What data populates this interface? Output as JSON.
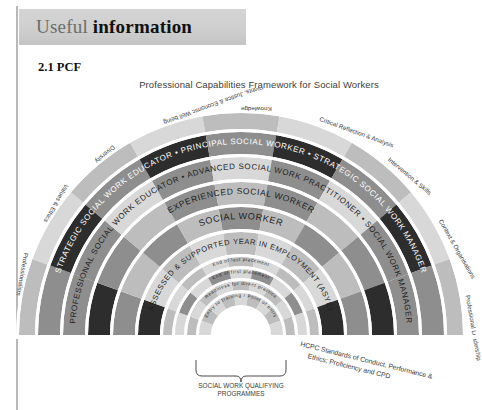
{
  "header": {
    "title_light": "Useful",
    "title_bold": "information",
    "band_color": "#cfcfcf"
  },
  "section": {
    "number_label": "2.1 PCF"
  },
  "figure": {
    "title": "Professional Capabilities Framework for Social Workers",
    "colors": {
      "dark": "#2d2d2d",
      "mid": "#8e8e8e",
      "light": "#bdbdbd",
      "pale": "#d8d8d8",
      "gap": "#ffffff",
      "text_on_dark": "#ffffff",
      "text_on_light": "#1d1d1d",
      "label": "#3a3a3a"
    },
    "rings": [
      {
        "label": "PRINCIPAL SOCIAL WORKER",
        "level": 9,
        "text_color": "#ffffff"
      },
      {
        "label": "ADVANCED SOCIAL WORK PRACTITIONER",
        "level": 8,
        "text_color": "#1d1d1d"
      },
      {
        "label": "EXPERIENCED SOCIAL WORKER",
        "level": 7,
        "text_color": "#1d1d1d"
      },
      {
        "label": "SOCIAL WORKER",
        "level": 6,
        "text_color": "#1d1d1d"
      },
      {
        "label": "ASSESSED & SUPPORTED YEAR IN EMPLOYMENT (ASYE)",
        "level": 5,
        "text_color": "#1d1d1d"
      }
    ],
    "left_rings": [
      {
        "label": "STRATEGIC SOCIAL WORK EDUCATOR"
      },
      {
        "label": "PROFESSIONAL SOCIAL WORK EDUCATOR"
      }
    ],
    "right_rings": [
      {
        "label": "STRATEGIC SOCIAL WORK MANAGER"
      },
      {
        "label": "SOCIAL WORK MANAGER"
      }
    ],
    "separator_glyph": "•",
    "domains": [
      {
        "label": "Professionalism"
      },
      {
        "label": "Values & Ethics"
      },
      {
        "label": "Diversity"
      },
      {
        "label": "Rights, Justice & Economic Well being"
      },
      {
        "label": "Knowledge"
      },
      {
        "label": "Critical Reflection & Analysis"
      },
      {
        "label": "Intervention & Skills"
      },
      {
        "label": "Context & Organisations"
      },
      {
        "label": "Professional Leadership"
      }
    ],
    "inner_stages": [
      {
        "label": "End of last placement"
      },
      {
        "label": "End of first placement"
      },
      {
        "label": "Readiness for direct practice"
      },
      {
        "label": "Entry to training / Point of entry"
      }
    ],
    "captions": {
      "qualifying": "SOCIAL WORK QUALIFYING\nPROGRAMMES",
      "qualifying_line1": "SOCIAL WORK QUALIFYING",
      "qualifying_line2": "PROGRAMMES",
      "hcpc_line1": "HCPC Standards of Conduct, Performance &",
      "hcpc_line2": "Ethics; Proficiency and CPD"
    }
  }
}
